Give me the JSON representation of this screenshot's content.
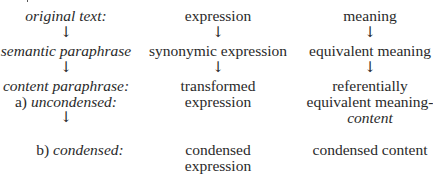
{
  "diagram": {
    "arrow_glyph": "↓",
    "left_column": {
      "original_text": "original text:",
      "semantic_paraphrase": "semantic paraphrase",
      "content_paraphrase": "content paraphrase:",
      "uncondensed_marker": "a)",
      "uncondensed_label": "uncondensed:",
      "condensed_marker": "b)",
      "condensed_label": "condensed:"
    },
    "middle_column": {
      "expression": "expression",
      "synonymic_expression": "synonymic expression",
      "transformed_line1": "transformed",
      "transformed_line2": "expression",
      "condensed_line1": "condensed",
      "condensed_line2": "expression"
    },
    "right_column": {
      "meaning": "meaning",
      "equivalent_meaning": "equivalent meaning",
      "referential_line1": "referentially",
      "referential_line2": "equivalent meaning-",
      "referential_line3": "content",
      "condensed_content": "condensed content"
    }
  }
}
